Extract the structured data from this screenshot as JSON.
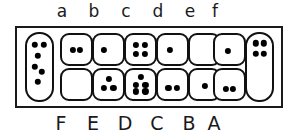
{
  "diagram": {
    "colors": {
      "ink": "#111111",
      "background": "#ffffff",
      "dot": "#000000"
    },
    "top_labels": [
      "a",
      "b",
      "c",
      "d",
      "e",
      "f"
    ],
    "bottom_labels": [
      "F",
      "E",
      "D",
      "C",
      "B",
      "A"
    ],
    "left_cell": {
      "name": "left-tall-cell",
      "dot_count": 6,
      "dots": [
        {
          "x": 30,
          "y": 16
        },
        {
          "x": 68,
          "y": 16
        },
        {
          "x": 44,
          "y": 33
        },
        {
          "x": 30,
          "y": 50
        },
        {
          "x": 60,
          "y": 57
        },
        {
          "x": 44,
          "y": 72
        }
      ]
    },
    "right_cell": {
      "name": "right-tall-cell",
      "dot_count": 4,
      "dots": [
        {
          "x": 34,
          "y": 14
        },
        {
          "x": 66,
          "y": 14
        },
        {
          "x": 34,
          "y": 30
        },
        {
          "x": 66,
          "y": 30
        }
      ]
    },
    "columns": [
      {
        "top_label": "a",
        "bottom_label": "F",
        "top_cell": {
          "dot_count": 2,
          "dots": [
            {
              "x": 37,
              "y": 50
            },
            {
              "x": 63,
              "y": 50
            }
          ]
        },
        "bottom_cell": {
          "dot_count": 0,
          "dots": []
        }
      },
      {
        "top_label": "b",
        "bottom_label": "E",
        "top_cell": {
          "dot_count": 1,
          "dots": [
            {
              "x": 34,
              "y": 52
            }
          ]
        },
        "bottom_cell": {
          "dot_count": 3,
          "dots": [
            {
              "x": 50,
              "y": 32
            },
            {
              "x": 33,
              "y": 63
            },
            {
              "x": 67,
              "y": 63
            }
          ]
        }
      },
      {
        "top_label": "c",
        "bottom_label": "D",
        "top_cell": {
          "dot_count": 4,
          "dots": [
            {
              "x": 34,
              "y": 34
            },
            {
              "x": 66,
              "y": 34
            },
            {
              "x": 34,
              "y": 64
            },
            {
              "x": 66,
              "y": 64
            }
          ]
        },
        "bottom_cell": {
          "dot_count": 5,
          "dots": [
            {
              "x": 50,
              "y": 24
            },
            {
              "x": 33,
              "y": 50
            },
            {
              "x": 67,
              "y": 50
            },
            {
              "x": 33,
              "y": 74
            },
            {
              "x": 67,
              "y": 74
            }
          ]
        }
      },
      {
        "top_label": "d",
        "bottom_label": "C",
        "top_cell": {
          "dot_count": 1,
          "dots": [
            {
              "x": 42,
              "y": 50
            }
          ]
        },
        "bottom_cell": {
          "dot_count": 2,
          "dots": [
            {
              "x": 36,
              "y": 62
            },
            {
              "x": 64,
              "y": 62
            }
          ]
        }
      },
      {
        "top_label": "e",
        "bottom_label": "B",
        "top_cell": {
          "dot_count": 0,
          "dots": []
        },
        "bottom_cell": {
          "dot_count": 1,
          "dots": [
            {
              "x": 50,
              "y": 55
            }
          ]
        }
      },
      {
        "top_label": "f",
        "bottom_label": "A",
        "top_cell": {
          "dot_count": 1,
          "dots": [
            {
              "x": 44,
              "y": 55
            }
          ]
        },
        "bottom_cell": {
          "dot_count": 2,
          "dots": [
            {
              "x": 37,
              "y": 66
            },
            {
              "x": 63,
              "y": 66
            }
          ]
        }
      }
    ],
    "geometry": {
      "frame": {
        "left": 15,
        "top": 26,
        "width": 268,
        "height": 82
      },
      "left_cell_pos": {
        "left": 25,
        "top": 32
      },
      "right_cell_pos": {
        "left": 245,
        "top": 32
      },
      "column_x": [
        60,
        92,
        124,
        156,
        188,
        213
      ],
      "top_row_y": 33,
      "bottom_row_y": 68,
      "label_top_x": [
        62,
        94,
        126,
        158,
        190,
        215
      ],
      "label_bottom_x": [
        61,
        93,
        125,
        157,
        189,
        214
      ]
    }
  }
}
